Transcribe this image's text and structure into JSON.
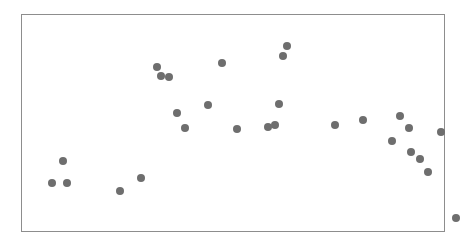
{
  "chart_data": {
    "type": "scatter",
    "title": "",
    "subtitle": "",
    "xlabel": "",
    "ylabel": "",
    "legend": [],
    "legend_position": "none",
    "grid": false,
    "xlim": [
      0,
      424
    ],
    "ylim": [
      0,
      218
    ],
    "marker": {
      "shape": "circle",
      "color": "#6e6e6e",
      "radius_px": 4.2,
      "opacity": 1
    },
    "series": [
      {
        "name": "points",
        "color": "#6e6e6e",
        "points": [
          {
            "x": 41,
            "y": 146
          },
          {
            "x": 30,
            "y": 168
          },
          {
            "x": 45,
            "y": 168
          },
          {
            "x": 98,
            "y": 176
          },
          {
            "x": 119,
            "y": 163
          },
          {
            "x": 135,
            "y": 52
          },
          {
            "x": 139,
            "y": 61
          },
          {
            "x": 147,
            "y": 62
          },
          {
            "x": 155,
            "y": 98
          },
          {
            "x": 163,
            "y": 113
          },
          {
            "x": 186,
            "y": 90
          },
          {
            "x": 200,
            "y": 48
          },
          {
            "x": 215,
            "y": 114
          },
          {
            "x": 246,
            "y": 112
          },
          {
            "x": 253,
            "y": 110
          },
          {
            "x": 257,
            "y": 89
          },
          {
            "x": 261,
            "y": 41
          },
          {
            "x": 265,
            "y": 31
          },
          {
            "x": 313,
            "y": 110
          },
          {
            "x": 341,
            "y": 105
          },
          {
            "x": 370,
            "y": 126
          },
          {
            "x": 378,
            "y": 101
          },
          {
            "x": 387,
            "y": 113
          },
          {
            "x": 389,
            "y": 137
          },
          {
            "x": 398,
            "y": 144
          },
          {
            "x": 406,
            "y": 157
          },
          {
            "x": 419,
            "y": 117
          },
          {
            "x": 434,
            "y": 203
          }
        ]
      }
    ]
  },
  "frame": {
    "left": 21,
    "top": 14,
    "width": 424,
    "height": 218,
    "border_color": "#8d8d8d",
    "background_color": "#ffffff"
  },
  "canvas": {
    "width": 464,
    "height": 245,
    "background_color": "#ffffff"
  }
}
